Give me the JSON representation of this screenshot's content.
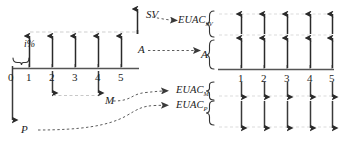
{
  "diagram": {
    "background_color": "#ffffff",
    "ink_color": "#1b1b1b",
    "faint_color": "#b9b9b9"
  },
  "left_diagram": {
    "name": "original-cash-flow-diagram",
    "timeline": {
      "ticks": [
        "0",
        "1",
        "2",
        "3",
        "4",
        "5"
      ],
      "axis_color": "#4a4a4a"
    },
    "interest_label": "i%",
    "labels": {
      "salvage_value": "SV",
      "annual_benefit": "A",
      "maintenance": "M",
      "present_cost": "P"
    },
    "flows": [
      {
        "name": "A",
        "direction": "up",
        "periods": [
          1,
          2,
          3,
          4,
          5
        ],
        "magnitude": "uniform"
      },
      {
        "name": "SV",
        "direction": "up",
        "periods": [
          5
        ],
        "magnitude": "tall"
      },
      {
        "name": "M",
        "direction": "down",
        "periods": [
          2,
          4
        ],
        "magnitude": "small"
      },
      {
        "name": "P",
        "direction": "down",
        "periods": [
          0
        ],
        "magnitude": "very-tall"
      }
    ]
  },
  "right_diagram": {
    "name": "euac-equivalent-diagram",
    "timeline": {
      "ticks": [
        "1",
        "2",
        "3",
        "4",
        "5"
      ],
      "axis_color": "#4a4a4a"
    },
    "rows": [
      {
        "label": "EUAC",
        "subscript": "SV",
        "direction": "up",
        "position": "above-upper",
        "count": 5
      },
      {
        "label": "A",
        "subscript": "",
        "direction": "up",
        "position": "above-lower",
        "count": 5
      },
      {
        "label": "EUAC",
        "subscript": "M",
        "direction": "down",
        "position": "below-upper",
        "count": 5
      },
      {
        "label": "EUAC",
        "subscript": "P",
        "direction": "down",
        "position": "below-lower",
        "count": 5
      }
    ]
  },
  "connectors": [
    {
      "name": "sv-to-euac-sv",
      "from": "SV",
      "to": "EUAC_SV",
      "style": "dotted-curve-arrow"
    },
    {
      "name": "a-to-a",
      "from": "A",
      "to": "A",
      "style": "dotted-straight-arrow"
    },
    {
      "name": "m-to-euac-m",
      "from": "M",
      "to": "EUAC_M",
      "style": "dotted-curve-arrow"
    },
    {
      "name": "p-to-euac-p",
      "from": "P",
      "to": "EUAC_P",
      "style": "dotted-curve-arrow"
    }
  ]
}
